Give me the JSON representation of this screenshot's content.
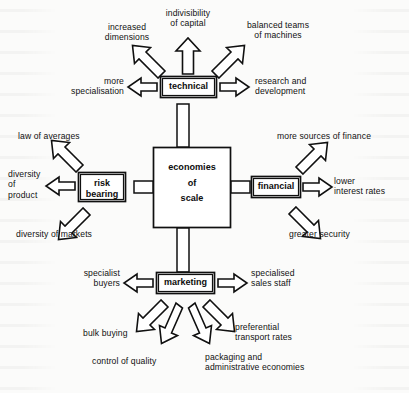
{
  "diagram": {
    "title": "economies of scale",
    "type": "spider-diagram",
    "center": {
      "label": "economies\nof\nscale",
      "lines": [
        "economies",
        "of",
        "scale"
      ]
    },
    "colors": {
      "ink": "#101010",
      "paper": "#fbfbfa",
      "fill": "#ffffff"
    },
    "branches": [
      {
        "id": "technical",
        "label": "technical",
        "position": "top",
        "outputs": [
          {
            "id": "increased-dimensions",
            "label": "increased\ndimensions"
          },
          {
            "id": "indivisibility-of-capital",
            "label": "indivisibility\nof capital"
          },
          {
            "id": "balanced-teams-of-machines",
            "label": "balanced teams\nof machines"
          },
          {
            "id": "more-specialisation",
            "label": "more\nspecialisation"
          },
          {
            "id": "research-and-development",
            "label": "research and\ndevelopment"
          }
        ]
      },
      {
        "id": "risk-bearing",
        "label": "risk\nbearing",
        "position": "left",
        "outputs": [
          {
            "id": "law-of-averages",
            "label": "law of averages"
          },
          {
            "id": "diversity-of-product",
            "label": "diversity\nof\nproduct"
          },
          {
            "id": "diversity-of-markets",
            "label": "diversity of markets"
          }
        ]
      },
      {
        "id": "financial",
        "label": "financial",
        "position": "right",
        "outputs": [
          {
            "id": "more-sources-of-finance",
            "label": "more sources of finance"
          },
          {
            "id": "lower-interest-rates",
            "label": "lower\ninterest rates"
          },
          {
            "id": "greater-security",
            "label": "greater security"
          }
        ]
      },
      {
        "id": "marketing",
        "label": "marketing",
        "position": "bottom",
        "outputs": [
          {
            "id": "specialist-buyers",
            "label": "specialist\nbuyers"
          },
          {
            "id": "specialised-sales-staff",
            "label": "specialised\nsales staff"
          },
          {
            "id": "bulk-buying",
            "label": "bulk buying"
          },
          {
            "id": "control-of-quality",
            "label": "control of quality"
          },
          {
            "id": "preferential-transport-rates",
            "label": "preferential\ntransport rates"
          },
          {
            "id": "packaging-and-administrative-economies",
            "label": "packaging and\nadministrative economies"
          }
        ]
      }
    ]
  }
}
